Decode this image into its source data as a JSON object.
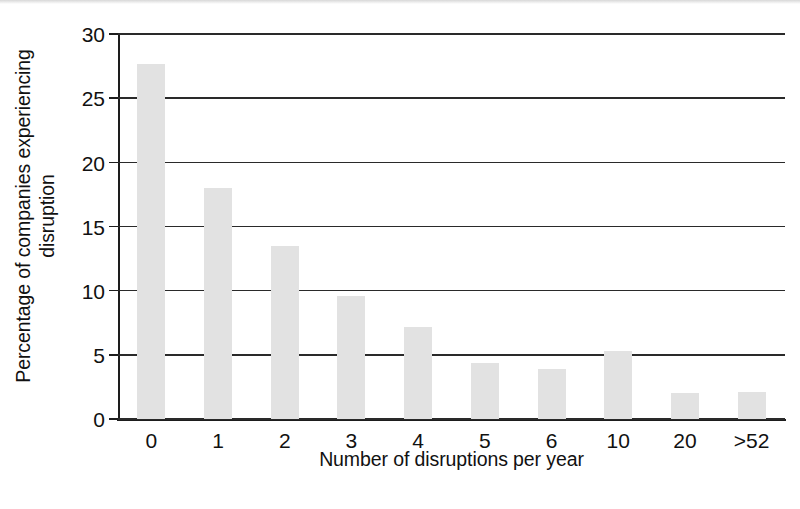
{
  "chart_data": {
    "type": "bar",
    "title": "",
    "subtitle": "",
    "xlabel": "Number of disruptions per year",
    "ylabel_line1": "Percentage of companies experiencing",
    "ylabel_line2": "disruption",
    "ylabel": "Percentage of companies experiencing disruption",
    "categories": [
      "0",
      "1",
      "2",
      "3",
      "4",
      "5",
      "6",
      "10",
      "20",
      ">52"
    ],
    "values": [
      27.7,
      18.0,
      13.5,
      9.6,
      7.2,
      4.4,
      3.9,
      5.3,
      2.0,
      2.1
    ],
    "series": [
      {
        "name": "Percentage of companies experiencing disruption",
        "values": [
          27.7,
          18.0,
          13.5,
          9.6,
          7.2,
          4.4,
          3.9,
          5.3,
          2.0,
          2.1
        ]
      }
    ],
    "ylim": [
      0,
      30
    ],
    "yticks": [
      0,
      5,
      10,
      15,
      20,
      25,
      30
    ],
    "ytick_labels": [
      "0",
      "5",
      "10",
      "15",
      "20",
      "25",
      "30"
    ],
    "grid": true,
    "grid_axis": "y",
    "legend": false,
    "legend_position": "none",
    "bar_color": "#e2e2e2",
    "axis_color": "#1d1d1d",
    "background_color": "#ffffff"
  }
}
